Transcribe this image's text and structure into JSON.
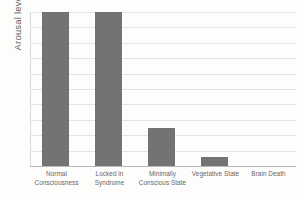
{
  "chart_data": {
    "type": "bar",
    "title": "",
    "subtitle": "",
    "xlabel": "",
    "ylabel": "Arousal level",
    "categories": [
      "Normal Consciousness",
      "Locked in Syndrome",
      "Minimally Conscious State",
      "Vegetative State",
      "Brain Death"
    ],
    "category_lines": [
      [
        "Normal",
        "Consciousness"
      ],
      [
        "Locked in",
        "Syndrome"
      ],
      [
        "Minimally",
        "Conscious State"
      ],
      [
        "Vegetative State",
        ""
      ],
      [
        "Brain Death",
        ""
      ]
    ],
    "values": [
      100,
      100,
      25,
      6,
      0
    ],
    "ylim": [
      0,
      100
    ],
    "ytick_labels": [],
    "grid": true,
    "gridline_count": 10,
    "legend": "none",
    "bar_color": "#737373",
    "gridline_color": "#e3e3e3",
    "axis_color": "#b9b9b9"
  },
  "axes": {
    "y_title": "Arousal level"
  }
}
